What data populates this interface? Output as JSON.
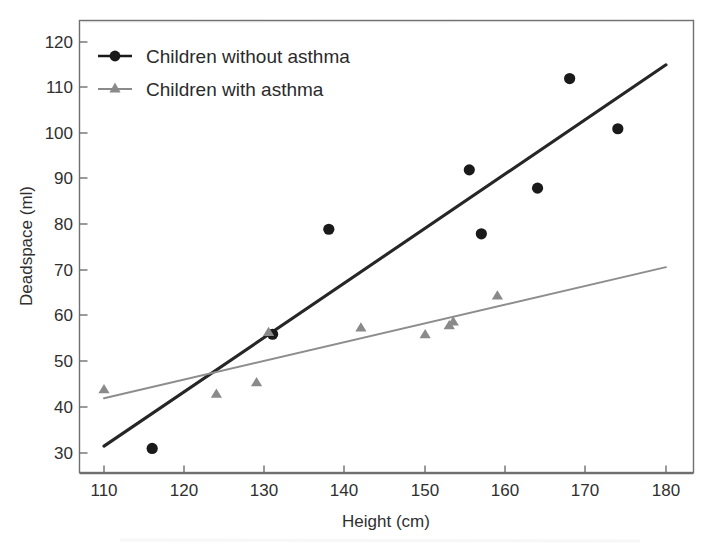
{
  "chart_data": {
    "type": "scatter",
    "title": "",
    "xlabel": "Height (cm)",
    "ylabel": "Deadspace (ml)",
    "xlim": [
      107,
      182
    ],
    "ylim": [
      27,
      124
    ],
    "xticks": [
      110,
      120,
      130,
      140,
      150,
      160,
      170,
      180
    ],
    "yticks": [
      30,
      40,
      50,
      60,
      70,
      80,
      90,
      100,
      110,
      120
    ],
    "grid": false,
    "legend_position": "top-left",
    "series": [
      {
        "name": "Children without asthma",
        "marker": "circle",
        "color": "#1a1a1a",
        "points": [
          {
            "x": 116,
            "y": 31
          },
          {
            "x": 131,
            "y": 56
          },
          {
            "x": 138,
            "y": 79
          },
          {
            "x": 155.5,
            "y": 92
          },
          {
            "x": 157,
            "y": 78
          },
          {
            "x": 164,
            "y": 88
          },
          {
            "x": 168,
            "y": 112
          },
          {
            "x": 174,
            "y": 101
          }
        ],
        "fit_line": {
          "x1": 110,
          "y1": 31.5,
          "x2": 180,
          "y2": 115.0
        }
      },
      {
        "name": "Children with asthma",
        "marker": "triangle",
        "color": "#8a8a8a",
        "points": [
          {
            "x": 110,
            "y": 44
          },
          {
            "x": 124,
            "y": 43
          },
          {
            "x": 129,
            "y": 45.5
          },
          {
            "x": 130.5,
            "y": 56.5
          },
          {
            "x": 142,
            "y": 57.5
          },
          {
            "x": 150,
            "y": 56
          },
          {
            "x": 153,
            "y": 58
          },
          {
            "x": 153.5,
            "y": 58.8
          },
          {
            "x": 159,
            "y": 64.5
          }
        ],
        "fit_line": {
          "x1": 110,
          "y1": 42.0,
          "x2": 180,
          "y2": 70.7
        }
      }
    ]
  },
  "legend": {
    "items": [
      {
        "label": "Children without asthma",
        "marker": "circle",
        "color": "#1a1a1a"
      },
      {
        "label": "Children with asthma",
        "marker": "triangle",
        "color": "#8a8a8a"
      }
    ]
  },
  "axes": {
    "x_title": "Height (cm)",
    "y_title": "Deadspace (ml)",
    "x_tick_labels": [
      "110",
      "120",
      "130",
      "140",
      "150",
      "160",
      "170",
      "180"
    ],
    "y_tick_labels": [
      "30",
      "40",
      "50",
      "60",
      "70",
      "80",
      "90",
      "100",
      "110",
      "120"
    ]
  },
  "colors": {
    "background": "#ffffff",
    "frame": "#6f6f6f",
    "text": "#2f2f2f",
    "series_without_asthma": "#1a1a1a",
    "series_with_asthma": "#8a8a8a"
  }
}
